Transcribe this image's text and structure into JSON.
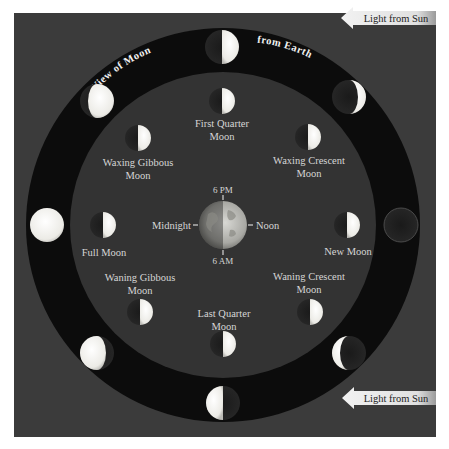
{
  "diagram": {
    "title_arc": {
      "left": "View of Moon",
      "right": "from Earth"
    },
    "sun_arrows": [
      {
        "label": "Light from Sun",
        "position": "top-right"
      },
      {
        "label": "Light from Sun",
        "position": "bottom-right"
      }
    ],
    "earth": {
      "time_labels": {
        "top": "6 PM",
        "bottom": "6 AM",
        "left": "Midnight",
        "right": "Noon"
      }
    },
    "inner_phase_labels": {
      "first_quarter": [
        "First Quarter",
        "Moon"
      ],
      "waxing_crescent": [
        "Waxing Crescent",
        "Moon"
      ],
      "new_moon": [
        "New Moon"
      ],
      "waning_crescent": [
        "Waning Crescent",
        "Moon"
      ],
      "last_quarter": [
        "Last Quarter",
        "Moon"
      ],
      "waning_gibbous": [
        "Waning Gibbous",
        "Moon"
      ],
      "full_moon": [
        "Full Moon"
      ],
      "waxing_gibbous": [
        "Waxing Gibbous",
        "Moon"
      ]
    },
    "colors": {
      "background": "#3b3b3b",
      "ring": "#0c0c0c",
      "inner_disk": "#333333",
      "moon_lit": "#f4f4f0",
      "moon_dark": "#1c1c1c",
      "label_text": "#d6d6d6",
      "arrow_fill": "#e6e6e6"
    }
  }
}
